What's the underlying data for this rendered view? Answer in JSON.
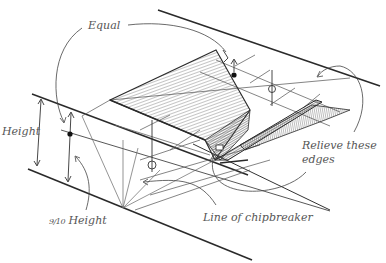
{
  "diagram": {
    "type": "technical-sketch",
    "labels": {
      "equal": "Equal",
      "height": "Height",
      "nine_tenths_prefix": "9/10",
      "nine_tenths_height": "Height",
      "line_of_chipbreaker": "Line of chipbreaker",
      "relieve_line1": "Relieve these",
      "relieve_line2": "edges"
    },
    "colors": {
      "ink": "#2a2a2a",
      "light_ink": "#6a6a6a",
      "label": "#555555",
      "background": "#ffffff"
    }
  }
}
